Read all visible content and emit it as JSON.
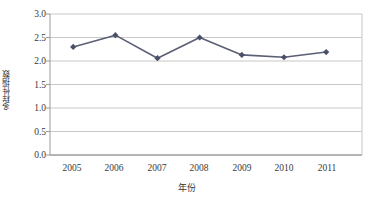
{
  "chart_data": {
    "type": "line",
    "title": "",
    "xlabel": "年份",
    "ylabel": "多样性指数",
    "categories": [
      "2005",
      "2006",
      "2007",
      "2008",
      "2009",
      "2010",
      "2011"
    ],
    "values": [
      2.3,
      2.55,
      2.06,
      2.5,
      2.13,
      2.08,
      2.19
    ],
    "series": [
      {
        "name": "多样性指数",
        "values": [
          2.3,
          2.55,
          2.06,
          2.5,
          2.13,
          2.08,
          2.19
        ]
      }
    ],
    "ylim": [
      0.0,
      3.0
    ],
    "ytick_labels": [
      "0.0",
      "0.5",
      "1.0",
      "1.5",
      "2.0",
      "2.5",
      "3.0"
    ],
    "ytick_values": [
      0.0,
      0.5,
      1.0,
      1.5,
      2.0,
      2.5,
      3.0
    ],
    "xtick_labels": [
      "2005",
      "2006",
      "2007",
      "2008",
      "2009",
      "2010",
      "2011"
    ],
    "grid": "horizontal",
    "legend": "none",
    "marker": "diamond",
    "colors": {
      "line": "#5a5f73",
      "marker": "#4a5068",
      "grid": "#c8c8c8",
      "axis": "#9a9a9a",
      "text": "#3a3a3a"
    }
  }
}
